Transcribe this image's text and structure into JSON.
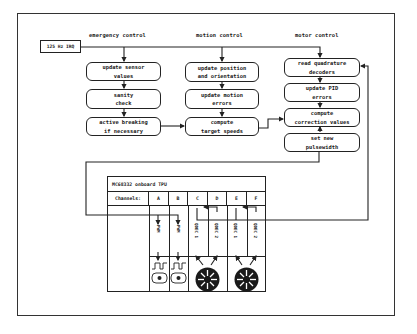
{
  "diagram": {
    "irq_label": "125 Hz IRQ",
    "columns": [
      {
        "header": "emergency control",
        "steps": [
          "update sensor\nvalues",
          "sanity\ncheck",
          "active breaking\nif necessary"
        ]
      },
      {
        "header": "motion control",
        "steps": [
          "update position\nand orientation",
          "update motion\nerrors",
          "compute\ntarget speeds"
        ]
      },
      {
        "header": "motor control",
        "steps": [
          "read quadrature\ndecoders",
          "update PID\nerrors",
          "compute\ncorrection values",
          "set new\npulsewidth"
        ]
      }
    ],
    "tpu": {
      "title": "MC68332 onboard TPU",
      "channels_label": "Channels:",
      "channels": [
        "A",
        "B",
        "C",
        "D",
        "E",
        "F"
      ],
      "functions": [
        "PWM",
        "PWM",
        "QDEC 1",
        "QDEC 2",
        "QDEC 1",
        "QDEC 2"
      ],
      "devices": [
        "dc-motor-icon",
        "dc-motor-icon",
        "encoder-wheel-icon",
        "encoder-wheel-icon"
      ]
    }
  }
}
